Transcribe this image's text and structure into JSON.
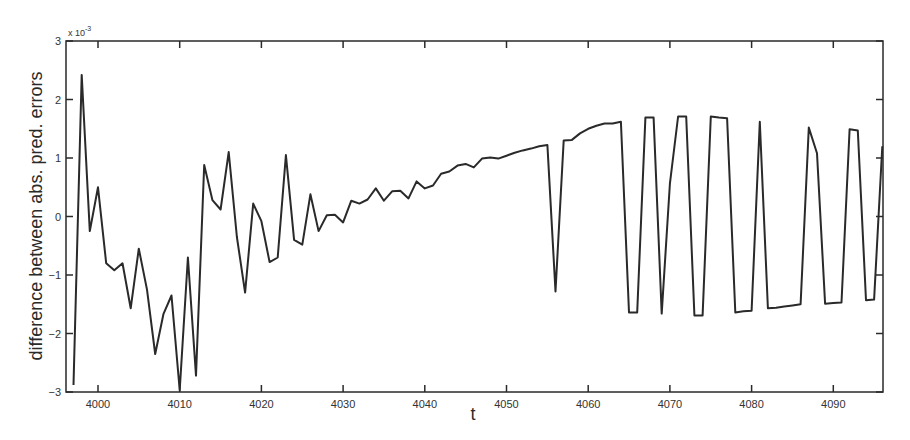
{
  "chart_data": {
    "type": "line",
    "title": "",
    "xlabel": "t",
    "ylabel": "difference between abs. pred. errors",
    "y_scale_label": "x 10^-3",
    "y_exponent_base": "x 10",
    "y_exponent": "-3",
    "xlim": [
      3996,
      4096
    ],
    "ylim": [
      -3,
      3
    ],
    "xticks": [
      4000,
      4010,
      4020,
      4030,
      4040,
      4050,
      4060,
      4070,
      4080,
      4090
    ],
    "yticks": [
      -3,
      -2,
      -1,
      0,
      1,
      2,
      3
    ],
    "grid": false,
    "legend": null,
    "series": [
      {
        "name": "difference",
        "color": "#2a2a2a",
        "x": [
          3997,
          3998,
          3999,
          4000,
          4001,
          4002,
          4003,
          4004,
          4005,
          4006,
          4007,
          4008,
          4009,
          4010,
          4011,
          4012,
          4013,
          4014,
          4015,
          4016,
          4017,
          4018,
          4019,
          4020,
          4021,
          4022,
          4023,
          4024,
          4025,
          4026,
          4027,
          4028,
          4029,
          4030,
          4031,
          4032,
          4033,
          4034,
          4035,
          4036,
          4037,
          4038,
          4039,
          4040,
          4041,
          4042,
          4043,
          4044,
          4045,
          4046,
          4047,
          4048,
          4049,
          4050,
          4051,
          4052,
          4053,
          4054,
          4055,
          4056,
          4057,
          4058,
          4059,
          4060,
          4061,
          4062,
          4063,
          4064,
          4065,
          4066,
          4067,
          4068,
          4069,
          4070,
          4071,
          4072,
          4073,
          4074,
          4075,
          4076,
          4077,
          4078,
          4079,
          4080,
          4081,
          4082,
          4083,
          4084,
          4085,
          4086,
          4087,
          4088,
          4089,
          4090,
          4091,
          4092,
          4093,
          4094,
          4095,
          4096
        ],
        "values": [
          -2.88,
          2.42,
          -0.25,
          0.5,
          -0.8,
          -0.92,
          -0.8,
          -1.57,
          -0.55,
          -1.25,
          -2.35,
          -1.67,
          -1.35,
          -2.97,
          -0.7,
          -2.72,
          0.88,
          0.28,
          0.12,
          1.1,
          -0.35,
          -1.3,
          0.22,
          -0.08,
          -0.78,
          -0.7,
          1.05,
          -0.4,
          -0.48,
          0.38,
          -0.25,
          0.02,
          0.03,
          -0.1,
          0.27,
          0.22,
          0.29,
          0.48,
          0.27,
          0.43,
          0.44,
          0.31,
          0.6,
          0.48,
          0.53,
          0.73,
          0.77,
          0.87,
          0.9,
          0.84,
          0.99,
          1.01,
          0.99,
          1.04,
          1.09,
          1.13,
          1.16,
          1.2,
          1.22,
          -1.28,
          1.3,
          1.31,
          1.42,
          1.5,
          1.55,
          1.59,
          1.59,
          1.62,
          -1.64,
          -1.64,
          1.69,
          1.69,
          -1.66,
          0.56,
          1.71,
          1.71,
          -1.69,
          -1.69,
          1.71,
          1.69,
          1.68,
          -1.64,
          -1.62,
          -1.61,
          1.62,
          -1.57,
          -1.56,
          -1.54,
          -1.52,
          -1.5,
          1.52,
          1.08,
          -1.49,
          -1.48,
          -1.47,
          1.49,
          1.47,
          -1.43,
          -1.42,
          1.2
        ]
      }
    ]
  },
  "layout": {
    "plot_left": 66,
    "plot_right": 883,
    "plot_top": 41,
    "plot_bottom": 392,
    "x_origin_t": 4000,
    "x_origin_px": 98,
    "px_per_t": 8.17
  }
}
